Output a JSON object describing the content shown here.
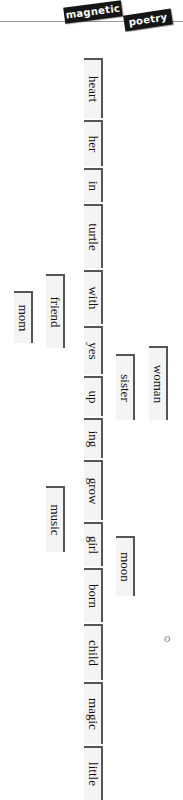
{
  "page": {
    "background_color": "#ffffff",
    "text_color": "#111111",
    "tile_background": "#f4f4f4",
    "tile_border_color": "#555555",
    "rule_color": "#9a9a9a",
    "orientation": "sideways",
    "scan_mark": "o"
  },
  "header": {
    "rule_name": "header-rule",
    "tiles": [
      {
        "label": "magnetic",
        "color": "#151515",
        "text_color": "#ffffff"
      },
      {
        "label": "poetry",
        "color": "#151515",
        "text_color": "#ffffff"
      }
    ]
  },
  "poem": {
    "columns": [
      {
        "name": "column-far-left",
        "words": [
          {
            "label": "mom",
            "x": 14,
            "y": 245,
            "length": 52
          }
        ]
      },
      {
        "name": "column-left",
        "words": [
          {
            "label": "friend",
            "x": 46,
            "y": 228,
            "length": 74
          },
          {
            "label": "music",
            "x": 46,
            "y": 440,
            "length": 66
          }
        ]
      },
      {
        "name": "column-main",
        "words": [
          {
            "label": "heart",
            "x": 84,
            "y": 12,
            "length": 60
          },
          {
            "label": "her",
            "x": 84,
            "y": 74,
            "length": 46
          },
          {
            "label": "in",
            "x": 84,
            "y": 122,
            "length": 34
          },
          {
            "label": "turtle",
            "x": 84,
            "y": 158,
            "length": 64
          },
          {
            "label": "with",
            "x": 84,
            "y": 224,
            "length": 54
          },
          {
            "label": "yes",
            "x": 84,
            "y": 280,
            "length": 48
          },
          {
            "label": "up",
            "x": 84,
            "y": 330,
            "length": 40
          },
          {
            "label": "ing",
            "x": 84,
            "y": 372,
            "length": 40
          },
          {
            "label": "grow",
            "x": 84,
            "y": 414,
            "length": 60
          },
          {
            "label": "girl",
            "x": 84,
            "y": 476,
            "length": 44
          },
          {
            "label": "born",
            "x": 84,
            "y": 522,
            "length": 54
          },
          {
            "label": "child",
            "x": 84,
            "y": 578,
            "length": 56
          },
          {
            "label": "magic",
            "x": 84,
            "y": 636,
            "length": 62
          },
          {
            "label": "little",
            "x": 84,
            "y": 700,
            "length": 54
          }
        ]
      },
      {
        "name": "column-right",
        "words": [
          {
            "label": "sister",
            "x": 116,
            "y": 308,
            "length": 66
          },
          {
            "label": "moon",
            "x": 116,
            "y": 490,
            "length": 60
          }
        ]
      },
      {
        "name": "column-far-right",
        "words": [
          {
            "label": "woman",
            "x": 149,
            "y": 300,
            "length": 74
          }
        ]
      }
    ]
  }
}
